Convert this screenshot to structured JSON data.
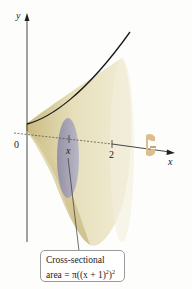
{
  "diagram": {
    "type": "solid-of-revolution",
    "axes": {
      "y_label": "y",
      "x_label": "x",
      "origin_label": "0",
      "tick_x_label": "x",
      "tick_2_label": "2"
    },
    "callout": {
      "line1": "Cross-sectional",
      "line2_prefix": "area = ",
      "line2_expr": "π((x + 1)",
      "line2_sup_inner": "2",
      "line2_close": ")",
      "line2_sup_outer": "2"
    },
    "colors": {
      "solid_fill": "#e8e0bd",
      "solid_shade": "#c9ba7f",
      "cross_section": "#9e9cb3",
      "curve": "#1a1a1a",
      "axis": "#333333",
      "rotation_arrow": "#d9b98a"
    }
  }
}
